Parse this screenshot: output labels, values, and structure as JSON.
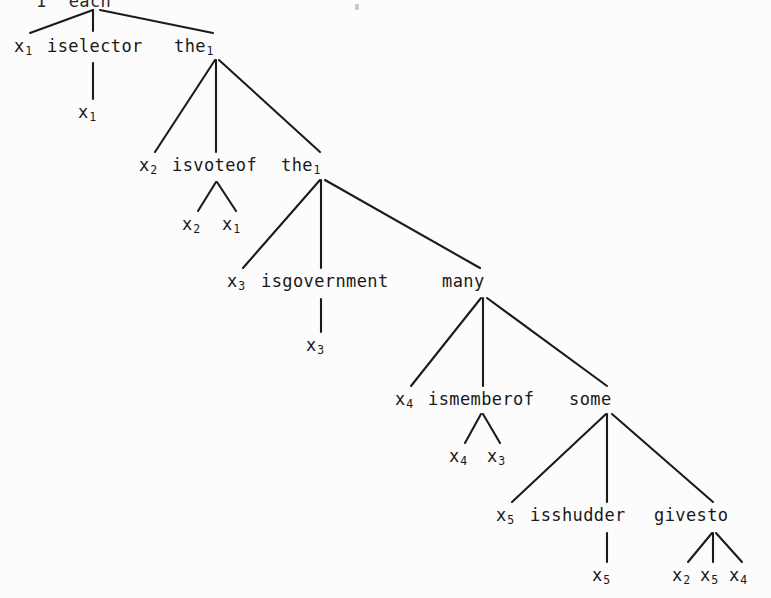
{
  "page": {
    "kind": "scanned-derivation-tree",
    "background_color": "#fcfcfc",
    "ink_color": "#181818",
    "width": 771,
    "height": 598
  },
  "top_row": {
    "fragment_left": "1",
    "fragment_right": "each",
    "note_visible": "partially cropped at top edge"
  },
  "levels": [
    {
      "id": "level-1",
      "variable": "x",
      "variable_index": "1",
      "predicate": "iselector",
      "quantifier": "the",
      "quantifier_index": "1",
      "children": [
        {
          "variable": "x",
          "index": "1"
        }
      ]
    },
    {
      "id": "level-2",
      "variable": "x",
      "variable_index": "2",
      "predicate": "isvoteof",
      "quantifier": "the",
      "quantifier_index": "1",
      "children": [
        {
          "variable": "x",
          "index": "2"
        },
        {
          "variable": "x",
          "index": "1"
        }
      ]
    },
    {
      "id": "level-3",
      "variable": "x",
      "variable_index": "3",
      "predicate": "isgovernment",
      "quantifier": "many",
      "quantifier_index": "",
      "children": [
        {
          "variable": "x",
          "index": "3"
        }
      ]
    },
    {
      "id": "level-4",
      "variable": "x",
      "variable_index": "4",
      "predicate": "ismemberof",
      "quantifier": "some",
      "quantifier_index": "",
      "children": [
        {
          "variable": "x",
          "index": "4"
        },
        {
          "variable": "x",
          "index": "3"
        }
      ]
    },
    {
      "id": "level-5",
      "variable": "x",
      "variable_index": "5",
      "predicate": "isshudder",
      "quantifier": "givesto",
      "quantifier_index": "",
      "children": [
        {
          "variable": "x",
          "index": "5"
        }
      ],
      "quantifier_children": [
        {
          "variable": "x",
          "index": "2"
        },
        {
          "variable": "x",
          "index": "5"
        },
        {
          "variable": "x",
          "index": "4"
        }
      ]
    }
  ],
  "labels": {
    "l1_var": "x",
    "l1_var_sub": "1",
    "l1_pred": "iselector",
    "l1_quant": "the",
    "l1_quant_sub": "1",
    "l1_leaf": "x",
    "l1_leaf_sub": "1",
    "l2_var": "x",
    "l2_var_sub": "2",
    "l2_pred": "isvoteof",
    "l2_quant": "the",
    "l2_quant_sub": "1",
    "l2_leaf_a": "x",
    "l2_leaf_a_sub": "2",
    "l2_leaf_b": "x",
    "l2_leaf_b_sub": "1",
    "l3_var": "x",
    "l3_var_sub": "3",
    "l3_pred": "isgovernment",
    "l3_quant": "many",
    "l3_leaf": "x",
    "l3_leaf_sub": "3",
    "l4_var": "x",
    "l4_var_sub": "4",
    "l4_pred": "ismemberof",
    "l4_quant": "some",
    "l4_leaf_a": "x",
    "l4_leaf_a_sub": "4",
    "l4_leaf_b": "x",
    "l4_leaf_b_sub": "3",
    "l5_var": "x",
    "l5_var_sub": "5",
    "l5_pred": "isshudder",
    "l5_quant": "givesto",
    "l5_leaf": "x",
    "l5_leaf_sub": "5",
    "l5_q_leaf_a": "x",
    "l5_q_leaf_a_sub": "2",
    "l5_q_leaf_b": "x",
    "l5_q_leaf_b_sub": "5",
    "l5_q_leaf_c": "x",
    "l5_q_leaf_c_sub": "4"
  }
}
